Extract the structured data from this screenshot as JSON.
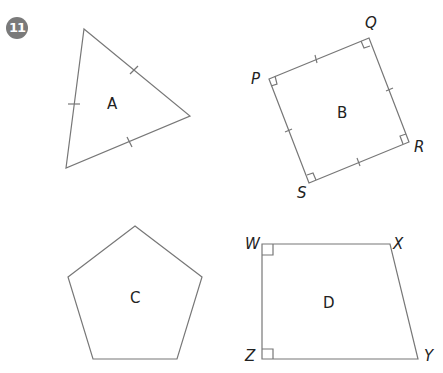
{
  "question_number": "11",
  "shapes": [
    {
      "id": "A",
      "label": "A",
      "type": "equilateral-triangle",
      "marks": "3 equal-side ticks"
    },
    {
      "id": "B",
      "label": "B",
      "type": "square",
      "vertices": [
        "P",
        "Q",
        "R",
        "S"
      ],
      "marks": "4 equal-side ticks, 4 right angles"
    },
    {
      "id": "C",
      "label": "C",
      "type": "regular-pentagon"
    },
    {
      "id": "D",
      "label": "D",
      "type": "right-trapezium",
      "vertices": [
        "W",
        "X",
        "Y",
        "Z"
      ],
      "marks": "right angles at W and Z"
    }
  ],
  "labels": {
    "A": "A",
    "B": "B",
    "C": "C",
    "D": "D",
    "P": "P",
    "Q": "Q",
    "R": "R",
    "S": "S",
    "W": "W",
    "X": "X",
    "Y": "Y",
    "Z": "Z"
  },
  "colors": {
    "stroke": "#777777",
    "badge": "#7a7a7a",
    "text": "#222222"
  }
}
